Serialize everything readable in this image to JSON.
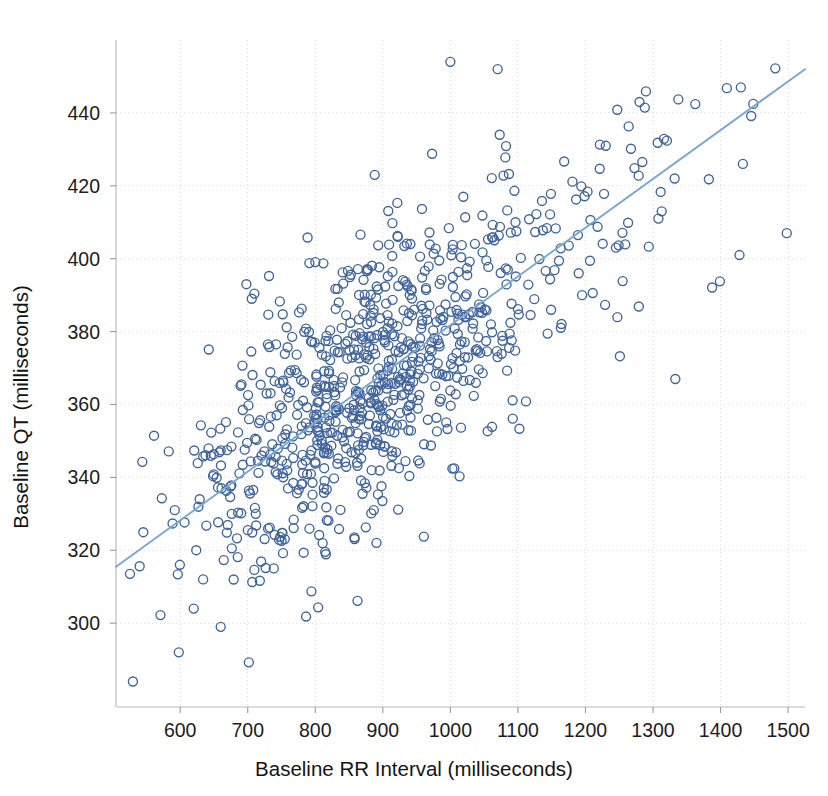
{
  "figure": {
    "title": "",
    "background_color": "#ffffff",
    "width": 828,
    "height": 796
  },
  "axes": {
    "x_title": "Baseline RR Interval (milliseconds)",
    "y_title": "Baseline QT (milliseconds)"
  },
  "chart_data": {
    "type": "scatter",
    "title": "",
    "xlabel": "Baseline RR Interval (milliseconds)",
    "ylabel": "Baseline QT (milliseconds)",
    "xlim": [
      505,
      1525
    ],
    "ylim": [
      277,
      460
    ],
    "xticks": [
      600,
      700,
      800,
      900,
      1000,
      1100,
      1200,
      1300,
      1400,
      1500
    ],
    "xticklabels": [
      "600",
      "700",
      "800",
      "900",
      "1000",
      "1100",
      "1200",
      "1300",
      "1400",
      "1500"
    ],
    "yticks": [
      300,
      320,
      340,
      360,
      380,
      400,
      420,
      440
    ],
    "yticklabels": [
      "300",
      "320",
      "340",
      "360",
      "380",
      "400",
      "420",
      "440"
    ],
    "grid": true,
    "grid_style": "dotted",
    "legend": false,
    "marker": "open-circle",
    "marker_color": "#40639c",
    "marker_size": 9,
    "n_points": 820,
    "trend_line": {
      "label": "linear fit",
      "color": "#7aa7d4",
      "x_start": 505,
      "y_start": 315.5,
      "x_end": 1525,
      "y_end": 452.0,
      "slope": 0.1338,
      "intercept": 248.0
    },
    "series": [
      {
        "name": "Subjects",
        "description": "Individual subject baseline QT plotted against baseline RR interval",
        "generator": {
          "seed": 20240517,
          "n": 820,
          "x_mean": 880,
          "x_sd": 135,
          "x_skew": 0.55,
          "x_min": 525,
          "x_max": 1512,
          "residual_sd": 18.5,
          "slope": 0.1338,
          "intercept": 248.0,
          "y_min": 282,
          "y_max": 456
        },
        "notable_points": [
          {
            "x": 530,
            "y": 284
          },
          {
            "x": 598,
            "y": 292
          },
          {
            "x": 592,
            "y": 331
          },
          {
            "x": 634,
            "y": 312
          },
          {
            "x": 620,
            "y": 304
          },
          {
            "x": 660,
            "y": 299
          },
          {
            "x": 698,
            "y": 393
          },
          {
            "x": 706,
            "y": 389
          },
          {
            "x": 888,
            "y": 423
          },
          {
            "x": 1000,
            "y": 454
          },
          {
            "x": 1070,
            "y": 452
          },
          {
            "x": 1073,
            "y": 434
          },
          {
            "x": 1280,
            "y": 443
          },
          {
            "x": 1308,
            "y": 411
          },
          {
            "x": 1332,
            "y": 422
          },
          {
            "x": 1333,
            "y": 367
          },
          {
            "x": 1430,
            "y": 447
          },
          {
            "x": 1433,
            "y": 426
          },
          {
            "x": 1428,
            "y": 401
          },
          {
            "x": 1498,
            "y": 407
          },
          {
            "x": 1190,
            "y": 396
          },
          {
            "x": 1195,
            "y": 390
          }
        ]
      }
    ]
  }
}
